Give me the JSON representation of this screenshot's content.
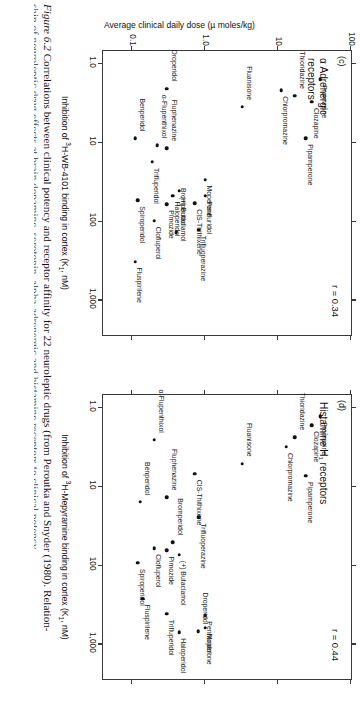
{
  "figure": {
    "caption_number": "Figure 6.2",
    "caption_line1": "Correlations between clinical potency and receptor affinity for 22 neuroleptic drugs (from Peroutka and Snyder (1980). Relation-",
    "caption_line2": "ship of neuroleptic drug effects at brain dopamine, serotonin, alpha-adrenergic and histamine receptors to clinical potency"
  },
  "yaxis": {
    "title": "Average clinical daily dose (µ moles/kg)",
    "ticks": [
      "100",
      "10",
      "1.0",
      "0.1"
    ]
  },
  "panel_c": {
    "letter": "(c)",
    "title": "α Adrenergic\nreceptors",
    "r_text": "r = 0.34",
    "xtitle_pre": "Inhibition of ",
    "xtitle_sup": "3",
    "xtitle_mid": "H-WB-4101 binding in cortex (K",
    "xtitle_sub": "1",
    "xtitle_post": ", nM)",
    "xticks": [
      "1.0",
      "10",
      "100",
      "1,000"
    ]
  },
  "panel_d": {
    "letter": "(d)",
    "title": "Histamine H₁ receptors",
    "r_text": "r = 0.44",
    "xtitle_pre": "Inhibition of ",
    "xtitle_sup": "3",
    "xtitle_mid": "H-Mepyramine binding in cortex (K",
    "xtitle_sub": "1",
    "xtitle_post": ", nM)",
    "xticks": [
      "1.0",
      "10",
      "100",
      "1,000"
    ]
  },
  "chart_data": [
    {
      "type": "scatter",
      "panel": "(c)",
      "title": "α Adrenergic receptors",
      "xlabel": "Inhibition of 3H-WB-4101 binding in cortex (K1, nM)",
      "ylabel": "Average clinical daily dose (µ moles/kg)",
      "xscale": "log",
      "yscale": "log",
      "xlim": [
        0.7,
        3000
      ],
      "ylim": [
        0.04,
        100
      ],
      "xticks": [
        1.0,
        10,
        100,
        1000
      ],
      "yticks": [
        100,
        10,
        1.0,
        0.1
      ],
      "r": 0.34,
      "grid": false,
      "legend": "none",
      "points": [
        {
          "label": "Promazine",
          "x": 1.6,
          "y": 38
        },
        {
          "label": "Clozapine",
          "x": 3.1,
          "y": 29
        },
        {
          "label": "Thioridazine",
          "x": 2.6,
          "y": 17
        },
        {
          "label": "Chlorpromazine",
          "x": 2.2,
          "y": 11
        },
        {
          "label": "Pipamperone",
          "x": 9.0,
          "y": 24
        },
        {
          "label": "Fluanisone",
          "x": 3.6,
          "y": 3.2
        },
        {
          "label": "Moperone",
          "x": 30,
          "y": 1.0
        },
        {
          "label": "Droperidol",
          "x": 2.1,
          "y": 0.3
        },
        {
          "label": "CIS-Thithixene",
          "x": 60,
          "y": 0.72
        },
        {
          "label": "Penfluridol",
          "x": 48,
          "y": 1.0
        },
        {
          "label": "Trifluoperazine",
          "x": 130,
          "y": 0.82
        },
        {
          "label": "(+) Butaclamol",
          "x": 42,
          "y": 0.44
        },
        {
          "label": "Fluphenazine",
          "x": 12,
          "y": 0.3
        },
        {
          "label": "Haloperidol",
          "x": 48,
          "y": 0.36
        },
        {
          "label": "Bromperidol",
          "x": 140,
          "y": 0.4
        },
        {
          "label": "Pimozide",
          "x": 62,
          "y": 0.3
        },
        {
          "label": "α-Flupenthixol",
          "x": 11,
          "y": 0.22
        },
        {
          "label": "Trifluperidol",
          "x": 18,
          "y": 0.19
        },
        {
          "label": "Clofluperol",
          "x": 100,
          "y": 0.2
        },
        {
          "label": "Benperidol",
          "x": 9.0,
          "y": 0.11
        },
        {
          "label": "Spiroperidol",
          "x": 55,
          "y": 0.12
        },
        {
          "label": "Fluspirilene",
          "x": 330,
          "y": 0.11
        }
      ]
    },
    {
      "type": "scatter",
      "panel": "(d)",
      "title": "Histamine H1 receptors",
      "xlabel": "Inhibition of 3H-Mepyramine binding in cortex (K1, nM)",
      "ylabel": "Average clinical daily dose (µ moles/kg)",
      "xscale": "log",
      "yscale": "log",
      "xlim": [
        0.7,
        3000
      ],
      "ylim": [
        0.04,
        100
      ],
      "xticks": [
        1.0,
        10,
        100,
        1000
      ],
      "yticks": [
        100,
        10,
        1.0,
        0.1
      ],
      "r": 0.44,
      "grid": false,
      "legend": "none",
      "points": [
        {
          "label": "Promazine",
          "x": 1.3,
          "y": 38
        },
        {
          "label": "Clozapine",
          "x": 1.7,
          "y": 29
        },
        {
          "label": "Thioridazine",
          "x": 2.4,
          "y": 17
        },
        {
          "label": "Chlorpromazine",
          "x": 3.2,
          "y": 13
        },
        {
          "label": "Pipamperone",
          "x": 7.5,
          "y": 24
        },
        {
          "label": "Fluanisone",
          "x": 5.2,
          "y": 3.2
        },
        {
          "label": "Moperone",
          "x": 630,
          "y": 1.0
        },
        {
          "label": "CIS-Thithixene",
          "x": 7.0,
          "y": 0.72
        },
        {
          "label": "Penfluridol",
          "x": 440,
          "y": 1.0
        },
        {
          "label": "Droperidol",
          "x": 700,
          "y": 0.8
        },
        {
          "label": "Haloperidol",
          "x": 720,
          "y": 0.44
        },
        {
          "label": "Trifluoperazine",
          "x": 25,
          "y": 0.82
        },
        {
          "label": "Fluphenazine",
          "x": 14,
          "y": 0.3
        },
        {
          "label": "(+) Butaclamol",
          "x": 75,
          "y": 0.44
        },
        {
          "label": "Bromperidol",
          "x": 52,
          "y": 0.36
        },
        {
          "label": "Pimozide",
          "x": 66,
          "y": 0.3
        },
        {
          "label": "α-Flupenthixol",
          "x": 2.6,
          "y": 0.2
        },
        {
          "label": "Trifluperidol",
          "x": 420,
          "y": 0.3
        },
        {
          "label": "Clofluperol",
          "x": 62,
          "y": 0.2
        },
        {
          "label": "Benperidol",
          "x": 16,
          "y": 0.13
        },
        {
          "label": "Spiroperidol",
          "x": 95,
          "y": 0.12
        },
        {
          "label": "Fluspirilene",
          "x": 270,
          "y": 0.14
        }
      ]
    }
  ]
}
